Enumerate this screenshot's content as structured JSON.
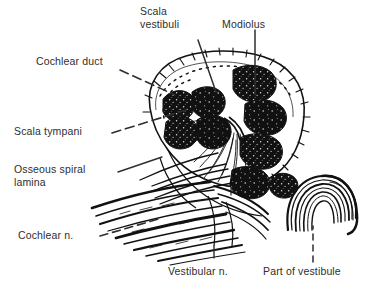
{
  "figure": {
    "style": "black and white line drawing",
    "background_color": "#ffffff",
    "ink_color": "#111111",
    "label_color": "#2e2e2e",
    "width": 384,
    "height": 292
  },
  "labels": {
    "scala_vestibuli": "Scala\nvestibuli",
    "modiolus": "Modiolus",
    "cochlear_duct": "Cochlear duct",
    "scala_tympani": "Scala tympani",
    "osseous_spiral_lamina": "Osseous spiral\nlamina",
    "cochlear_n": "Cochlear n.",
    "vestibular_n": "Vestibular n.",
    "part_of_vestibule": "Part of vestibule"
  },
  "leader_lines": [
    {
      "name": "scala-vestibuli-leader",
      "style": "solid",
      "from": [
        198,
        40
      ],
      "to": [
        216,
        92
      ]
    },
    {
      "name": "modiolus-leader",
      "style": "solid",
      "from": [
        255,
        30
      ],
      "to": [
        255,
        95
      ]
    },
    {
      "name": "cochlear-duct-leader",
      "style": "dashed",
      "from": [
        120,
        70
      ],
      "to": [
        175,
        95
      ]
    },
    {
      "name": "scala-tympani-leader",
      "style": "dashed",
      "from": [
        112,
        133
      ],
      "to": [
        185,
        110
      ]
    },
    {
      "name": "osseous-spiral-lamina-leader",
      "style": "solid",
      "from": [
        118,
        172
      ],
      "to": [
        160,
        158
      ]
    },
    {
      "name": "cochlear-n-leader",
      "style": "dashed",
      "from": [
        100,
        236
      ],
      "to": [
        160,
        218
      ]
    },
    {
      "name": "vestibular-n-leader",
      "style": "solid",
      "from": [
        214,
        258
      ],
      "to": [
        214,
        248
      ]
    },
    {
      "name": "part-of-vestibule-leader",
      "style": "dashed",
      "from": [
        313,
        262
      ],
      "to": [
        313,
        228
      ]
    }
  ]
}
